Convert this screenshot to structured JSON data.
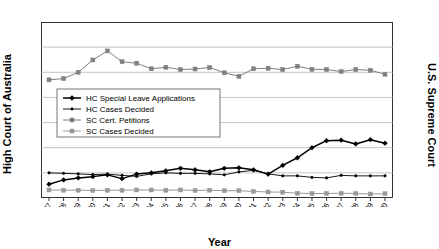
{
  "chart_data": {
    "type": "line",
    "title": "",
    "xlabel": "Year",
    "ylabel": "High Court of Australia",
    "ylabel_right": "U.S. Supreme Court",
    "grid": true,
    "legend_position": "upper-left-inside",
    "ylim": [
      0,
      700
    ],
    "ylim_right": [
      0,
      3500
    ],
    "yticks": [
      0,
      100,
      200,
      300,
      400,
      500,
      600,
      700
    ],
    "yticks_right": [
      0,
      500,
      1000,
      1500,
      2000,
      2500,
      3000,
      3500
    ],
    "categories": [
      "1977",
      "1978",
      "1979",
      "1980",
      "1981",
      "1982",
      "1983",
      "1984",
      "1985",
      "1986",
      "1987",
      "1988",
      "1989",
      "1990",
      "1991",
      "1992",
      "1993",
      "1994",
      "1995",
      "1996",
      "1997",
      "1998",
      "1999",
      "2000"
    ],
    "series": [
      {
        "name": "HC Special Leave Applications",
        "axis": "left",
        "color": "#000000",
        "marker": "diamond",
        "values": [
          55,
          72,
          80,
          85,
          92,
          77,
          95,
          100,
          108,
          118,
          112,
          104,
          118,
          120,
          112,
          95,
          130,
          160,
          200,
          228,
          230,
          215,
          232,
          218
        ]
      },
      {
        "name": "HC Cases Decided",
        "axis": "left",
        "color": "#000000",
        "marker": "dot",
        "values": [
          100,
          98,
          96,
          93,
          95,
          90,
          86,
          96,
          100,
          98,
          98,
          96,
          92,
          104,
          110,
          96,
          88,
          88,
          82,
          80,
          90,
          88,
          88,
          88
        ]
      },
      {
        "name": "SC Cert. Petitions",
        "axis": "right",
        "color": "#808080",
        "marker": "square",
        "values": [
          2350,
          2375,
          2500,
          2745,
          2925,
          2710,
          2680,
          2570,
          2600,
          2555,
          2565,
          2595,
          2490,
          2420,
          2570,
          2580,
          2555,
          2620,
          2560,
          2555,
          2515,
          2555,
          2540,
          2460
        ]
      },
      {
        "name": "SC Cases Decided",
        "axis": "right",
        "color": "#999999",
        "marker": "square",
        "values": [
          160,
          155,
          155,
          150,
          155,
          155,
          160,
          160,
          155,
          160,
          150,
          155,
          145,
          145,
          130,
          120,
          115,
          95,
          90,
          90,
          95,
          90,
          80,
          85
        ]
      }
    ],
    "legend_entries": [
      "HC Special Leave Applications",
      "HC Cases Decided",
      "SC Cert. Petitions",
      "SC Cases Decided"
    ]
  }
}
